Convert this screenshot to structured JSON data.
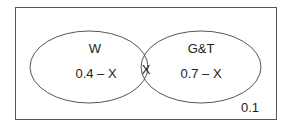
{
  "diagram": {
    "type": "venn",
    "universe_value": "0.1",
    "sets": [
      {
        "name": "W",
        "label": "W",
        "only_value": "0.4 – X"
      },
      {
        "name": "G&T",
        "label": "G&T",
        "only_value": "0.7 – X"
      }
    ],
    "intersection_value": "X",
    "colors": {
      "stroke": "#555555",
      "text": "#222222",
      "background": "#ffffff"
    }
  }
}
